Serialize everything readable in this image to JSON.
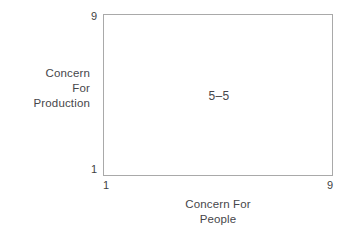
{
  "figure": {
    "name": "managerial-grid",
    "background_color": "#ffffff",
    "border_color": "#a9a9a9",
    "text_color": "#46464a"
  },
  "chart_data": {
    "type": "scatter",
    "title": "",
    "xlabel": "Concern For People",
    "ylabel": "Concern For Production",
    "xlim": [
      1,
      9
    ],
    "ylim": [
      1,
      9
    ],
    "grid": false,
    "legend": null,
    "x_ticks": [
      "1",
      "9"
    ],
    "y_ticks": [
      "1",
      "9"
    ],
    "annotations": [
      {
        "label": "5–5",
        "x": 5,
        "y": 5
      }
    ],
    "series": [
      {
        "name": "5–5",
        "x": [
          5
        ],
        "y": [
          5
        ]
      }
    ]
  },
  "axes": {
    "y": {
      "title_lines": [
        "Concern",
        "For",
        "Production"
      ],
      "tick_top": "9",
      "tick_bottom": "1"
    },
    "x": {
      "title_lines": [
        "Concern For",
        "People"
      ],
      "tick_left": "1",
      "tick_right": "9"
    }
  },
  "plot": {
    "cell_label": "5–5"
  }
}
